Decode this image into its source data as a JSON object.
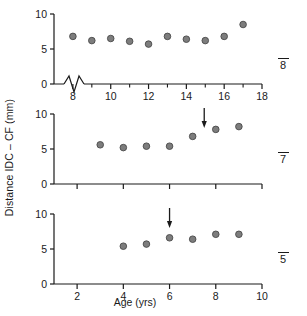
{
  "figure": {
    "ylabel": "Distance IDC – CF (mm)",
    "xlabel": "Age (yrs)",
    "marker_fill": "#7d7d7d",
    "marker_stroke": "#4a4a4a",
    "axis_color": "#1a1a1a"
  },
  "chart_data": {
    "type": "scatter",
    "title": "",
    "xlabel": "Age (yrs)",
    "ylabel": "Distance IDC – CF (mm)",
    "shared_ylim": [
      0,
      10
    ],
    "yticks": [
      0,
      5,
      10
    ],
    "grid": false,
    "legend": null,
    "panels": [
      {
        "id": "panel-top",
        "tag": "8",
        "tag_overline": true,
        "xlim": [
          7,
          18
        ],
        "xticks": [
          8,
          10,
          12,
          14,
          16,
          18
        ],
        "xtick_labels": [
          "8",
          "10",
          "12",
          "14",
          "16",
          "18"
        ],
        "minor_xticks": [
          9,
          11,
          13,
          15,
          17
        ],
        "axis_break": true,
        "ylim": [
          0,
          10
        ],
        "yticks": [
          0,
          5,
          10
        ],
        "ytick_labels": [
          "0",
          "5",
          "10"
        ],
        "arrow": null,
        "x": [
          8,
          9,
          10,
          11,
          12,
          13,
          14,
          15,
          16,
          17
        ],
        "y": [
          6.8,
          6.2,
          6.5,
          6.1,
          5.7,
          6.8,
          6.4,
          6.2,
          6.8,
          8.5
        ]
      },
      {
        "id": "panel-middle",
        "tag": "7",
        "tag_overline": true,
        "xlim": [
          1,
          10
        ],
        "xticks": [
          2,
          4,
          6,
          8,
          10
        ],
        "xtick_labels": [
          "",
          "",
          "",
          "",
          ""
        ],
        "minor_xticks": [],
        "axis_break": false,
        "ylim": [
          0,
          10
        ],
        "yticks": [
          0,
          5,
          10
        ],
        "ytick_labels": [
          "0",
          "5",
          "10"
        ],
        "arrow": {
          "x": 7.5,
          "label": ""
        },
        "x": [
          3,
          4,
          5,
          6,
          7,
          8,
          9
        ],
        "y": [
          5.6,
          5.2,
          5.4,
          5.4,
          6.8,
          7.8,
          8.2
        ]
      },
      {
        "id": "panel-bottom",
        "tag": "5",
        "tag_overline": true,
        "xlim": [
          1,
          10
        ],
        "xticks": [
          2,
          4,
          6,
          8,
          10
        ],
        "xtick_labels": [
          "2",
          "4",
          "6",
          "8",
          "10"
        ],
        "minor_xticks": [],
        "axis_break": false,
        "ylim": [
          0,
          10
        ],
        "yticks": [
          0,
          5,
          10
        ],
        "ytick_labels": [
          "0",
          "5",
          "10"
        ],
        "arrow": {
          "x": 6,
          "label": ""
        },
        "x": [
          4,
          5,
          6,
          7,
          8,
          9
        ],
        "y": [
          5.4,
          5.7,
          6.6,
          6.4,
          7.1,
          7.1
        ]
      }
    ]
  }
}
